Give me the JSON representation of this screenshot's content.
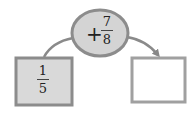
{
  "diagram": {
    "start_box": {
      "numerator": "1",
      "denominator": "5",
      "fill": "#d9d9d9"
    },
    "operation": {
      "operator": "+",
      "numerator": "7",
      "denominator": "8",
      "fill": "#d4d4d4"
    },
    "result_box": {
      "value": "",
      "fill": "#ffffff"
    },
    "colors": {
      "border": "#8c8c8c",
      "arrow": "#888888"
    }
  }
}
